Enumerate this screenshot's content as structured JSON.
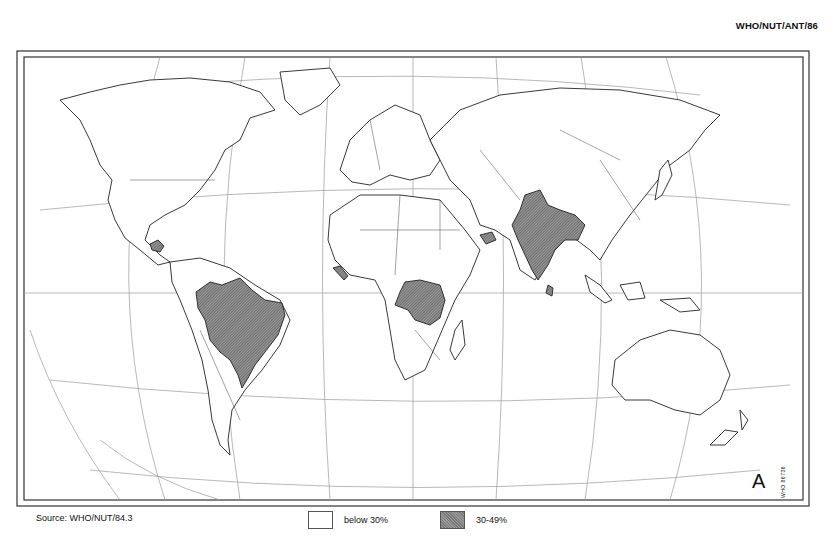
{
  "header": {
    "document_code": "WHO/NUT/ANT/86"
  },
  "map": {
    "panel_letter": "A",
    "tiny_code": "WHO 86736",
    "projection": "Robinson-like world projection with graticule",
    "colors": {
      "frame": "#333333",
      "graticule": "#888888",
      "coast": "#222222",
      "shaded": "#8a8a8a",
      "unshaded": "#ffffff"
    },
    "shaded_regions": [
      "India",
      "Bangladesh",
      "Brazil",
      "Zaire",
      "Guatemala / Honduras",
      "Sierra Leone / Liberia",
      "Yemen"
    ]
  },
  "footer": {
    "source": "Source: WHO/NUT/84.3",
    "legend": [
      {
        "key": "low",
        "label": "below 30%",
        "color": "#ffffff"
      },
      {
        "key": "high",
        "label": "30-49%",
        "color": "#8a8a8a"
      }
    ]
  }
}
